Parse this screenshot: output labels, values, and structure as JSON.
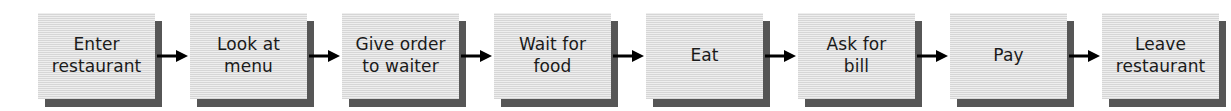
{
  "diagram": {
    "orientation": "left-to-right",
    "background_color": "#ffffff",
    "box_fill_color": "#d9d9d9",
    "box_shadow_color": "#565656",
    "text_color": "#1a1a1a",
    "arrow_color": "#000000",
    "connector_symbol": "arrow-right",
    "steps": [
      {
        "id": "step-1",
        "label": "Enter\nrestaurant",
        "order": 1
      },
      {
        "id": "step-2",
        "label": "Look at\nmenu",
        "order": 2
      },
      {
        "id": "step-3",
        "label": "Give order\nto waiter",
        "order": 3
      },
      {
        "id": "step-4",
        "label": "Wait for\nfood",
        "order": 4
      },
      {
        "id": "step-5",
        "label": "Eat",
        "order": 5
      },
      {
        "id": "step-6",
        "label": "Ask for\nbill",
        "order": 6
      },
      {
        "id": "step-7",
        "label": "Pay",
        "order": 7
      },
      {
        "id": "step-8",
        "label": "Leave\nrestaurant",
        "order": 8
      }
    ]
  }
}
